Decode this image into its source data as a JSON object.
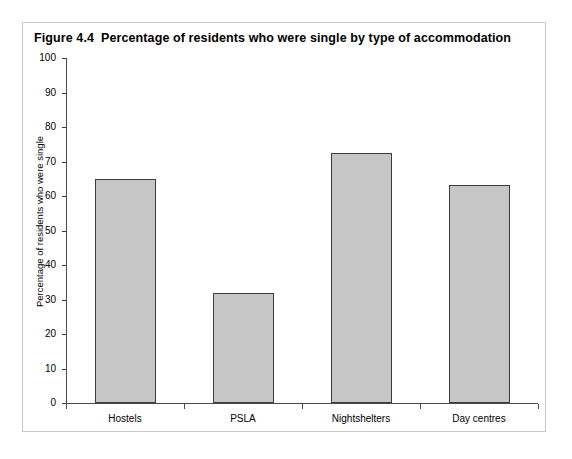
{
  "figure": {
    "number": "Figure 4.4",
    "title": "Percentage of residents who were single by type of accommodation"
  },
  "chart_data": {
    "type": "bar",
    "categories": [
      "Hostels",
      "PSLA",
      "Nightshelters",
      "Day centres"
    ],
    "values": [
      64.8,
      31.8,
      72.5,
      63.2
    ],
    "xlabel": "",
    "ylabel": "Percentage of residents who were single",
    "ylim": [
      0,
      100
    ],
    "ytick_labels": [
      "0",
      "10",
      "20",
      "30",
      "40",
      "50",
      "60",
      "70",
      "80",
      "90",
      "100"
    ],
    "ytick_values": [
      0,
      10,
      20,
      30,
      40,
      50,
      60,
      70,
      80,
      90,
      100
    ],
    "grid": false,
    "legend": null,
    "bar_fill_color": "#c6c6c6",
    "bar_edge_color": "#3c3c3c",
    "axis_color": "#4a4a4a",
    "frame_border_color": "#c9c9c9",
    "background_color": "#ffffff"
  }
}
